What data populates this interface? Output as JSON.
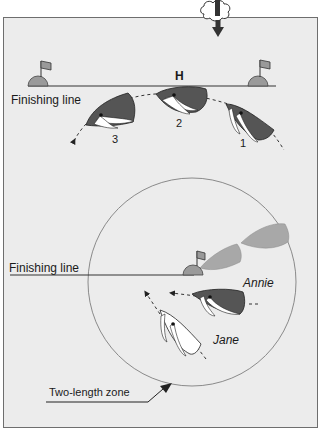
{
  "diagram": {
    "title_fragment": "",
    "colors": {
      "panel_bg": "#ececec",
      "panel_border": "#6e6e6e",
      "dark_hull": "#555555",
      "light_hull": "#a8a8a8",
      "sail": "#ffffff",
      "line": "#222222",
      "zone_circle": "#8a8a8a",
      "mark": "#9a9a9a"
    },
    "wind": {
      "icon": "cloud-wind-arrow-icon",
      "direction": "down"
    },
    "top_scene": {
      "mark_label": "H",
      "finishing_line_label": "Finishing line",
      "boats": [
        {
          "number_label": "3",
          "color": "dark",
          "position": "left"
        },
        {
          "number_label": "2",
          "color": "dark",
          "position": "center"
        },
        {
          "number_label": "1",
          "color": "dark",
          "position": "right"
        }
      ]
    },
    "bottom_scene": {
      "finishing_line_label": "Finishing line",
      "boats": [
        {
          "name_label": "Annie",
          "color": "dark"
        },
        {
          "name_label": "Jane",
          "color": "white"
        }
      ],
      "ghost_boats": 2,
      "zone_label": "Two-length zone"
    }
  }
}
